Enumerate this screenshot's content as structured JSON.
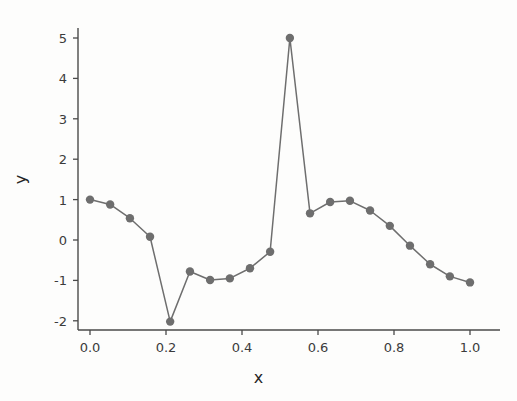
{
  "chart_data": {
    "type": "line",
    "title": "",
    "xlabel": "x",
    "ylabel": "y",
    "xlim": [
      -0.05,
      1.05
    ],
    "ylim": [
      -2.4,
      5.4
    ],
    "grid": false,
    "legend": null,
    "marker": "circle",
    "line_color": "#6e6e6e",
    "marker_color": "#6e6e6e",
    "xticks": [
      "0.0",
      "0.2",
      "0.4",
      "0.6",
      "0.8",
      "1.0"
    ],
    "xtick_values": [
      0.0,
      0.2,
      0.4,
      0.6,
      0.8,
      1.0
    ],
    "yticks": [
      "5",
      "4",
      "3",
      "2",
      "1",
      "0",
      "-1",
      "-2"
    ],
    "ytick_values": [
      5,
      4,
      3,
      2,
      1,
      0,
      -1,
      -2
    ],
    "x": [
      0.0,
      0.053,
      0.105,
      0.158,
      0.211,
      0.263,
      0.316,
      0.368,
      0.421,
      0.474,
      0.526,
      0.579,
      0.632,
      0.684,
      0.737,
      0.789,
      0.842,
      0.895,
      0.947,
      1.0
    ],
    "y": [
      1.0,
      0.88,
      0.54,
      0.08,
      -2.02,
      -0.78,
      -0.99,
      -0.95,
      -0.7,
      -0.29,
      5.0,
      0.66,
      0.94,
      0.97,
      0.73,
      0.35,
      -0.14,
      -0.6,
      -0.9,
      -1.05
    ],
    "values": [
      1.0,
      0.88,
      0.54,
      0.08,
      -2.02,
      -0.78,
      -0.99,
      -0.95,
      -0.7,
      -0.29,
      5.0,
      0.66,
      0.94,
      0.97,
      0.73,
      0.35,
      -0.14,
      -0.6,
      -0.9,
      -1.05
    ]
  },
  "axes": {
    "x_axis_label": "x",
    "y_axis_label": "y"
  }
}
